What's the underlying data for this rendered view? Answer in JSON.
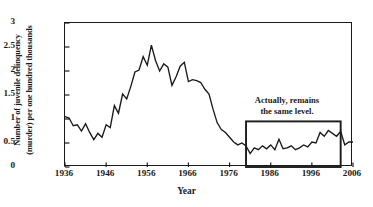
{
  "chart_data": {
    "type": "line",
    "title": "",
    "xlabel": "Year",
    "ylabel_lines": [
      "Number of juvenile delinquency",
      "(murder) per one hundred thousands"
    ],
    "ylabel": "Number of juvenile delinquency (murder) per one hundred thousands",
    "xlim": [
      1936,
      2006
    ],
    "ylim": [
      0,
      3
    ],
    "grid": false,
    "legend": null,
    "xticks": [
      1936,
      1946,
      1956,
      1966,
      1976,
      1986,
      1996,
      2006
    ],
    "xtick_labels": [
      "1936",
      "1946",
      "1956",
      "1966",
      "1976",
      "1986",
      "1996",
      "2006"
    ],
    "yticks": [
      0,
      0.5,
      1,
      1.5,
      2,
      2.5,
      3
    ],
    "ytick_labels": [
      "0",
      "0.5",
      "1",
      "1.5",
      "2",
      "2.5",
      "3"
    ],
    "line_color": "#1a1a1a",
    "x": [
      1936,
      1937,
      1938,
      1939,
      1940,
      1941,
      1942,
      1943,
      1944,
      1945,
      1946,
      1947,
      1948,
      1949,
      1950,
      1951,
      1952,
      1953,
      1954,
      1955,
      1956,
      1957,
      1958,
      1959,
      1960,
      1961,
      1962,
      1963,
      1964,
      1965,
      1966,
      1967,
      1968,
      1969,
      1970,
      1971,
      1972,
      1973,
      1974,
      1975,
      1976,
      1977,
      1978,
      1979,
      1980,
      1981,
      1982,
      1983,
      1984,
      1985,
      1986,
      1987,
      1988,
      1989,
      1990,
      1991,
      1992,
      1993,
      1994,
      1995,
      1996,
      1997,
      1998,
      1999,
      2000,
      2001,
      2002,
      2003,
      2004,
      2005,
      2006
    ],
    "values": [
      1.05,
      1.02,
      0.86,
      0.88,
      0.75,
      0.9,
      0.72,
      0.57,
      0.7,
      0.62,
      0.88,
      0.82,
      1.28,
      1.12,
      1.52,
      1.42,
      1.68,
      1.98,
      2.02,
      2.3,
      2.12,
      2.54,
      2.22,
      2.0,
      2.15,
      2.08,
      1.7,
      1.88,
      2.1,
      2.18,
      1.78,
      1.82,
      1.8,
      1.76,
      1.62,
      1.52,
      1.2,
      0.92,
      0.78,
      0.72,
      0.62,
      0.52,
      0.46,
      0.5,
      0.44,
      0.28,
      0.4,
      0.36,
      0.44,
      0.38,
      0.46,
      0.36,
      0.58,
      0.38,
      0.4,
      0.44,
      0.36,
      0.4,
      0.46,
      0.42,
      0.52,
      0.5,
      0.72,
      0.64,
      0.76,
      0.7,
      0.64,
      0.74,
      0.46,
      0.52,
      0.52
    ],
    "annotations": [
      {
        "name": "same-level-callout",
        "text_lines": [
          "Actually, remains",
          "the same level."
        ],
        "text": "Actually, remains the same level.",
        "box_x_range": [
          1980,
          2003
        ],
        "box_y_range": [
          0,
          0.95
        ]
      }
    ]
  }
}
